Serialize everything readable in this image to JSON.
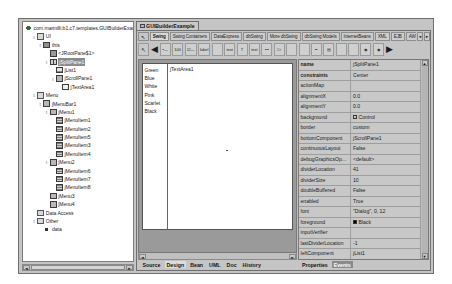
{
  "window": {
    "title": "GUIBuilderExample"
  },
  "structure": {
    "root_label": "com.marinilli.b1.c7.templates.GUIBuilderExample",
    "nodes": [
      {
        "label": "UI",
        "depth": 1,
        "icon": "folder-icon",
        "handle": "expanded",
        "selected": false
      },
      {
        "label": "this",
        "depth": 2,
        "icon": "frame-icon",
        "handle": "expanded",
        "selected": false
      },
      {
        "label": "<JRootPane$1>",
        "depth": 3,
        "icon": "root-pane-icon",
        "handle": "none",
        "selected": false
      },
      {
        "label": "jSplitPane1",
        "depth": 3,
        "icon": "split-pane-icon",
        "handle": "expanded",
        "selected": true
      },
      {
        "label": "jList1",
        "depth": 4,
        "icon": "list-icon",
        "handle": "none",
        "selected": false
      },
      {
        "label": "jScrollPane1",
        "depth": 4,
        "icon": "panel-icon",
        "handle": "expanded",
        "selected": false
      },
      {
        "label": "jTextArea1",
        "depth": 5,
        "icon": "text-area-icon",
        "handle": "none",
        "selected": false
      },
      {
        "label": "Menu",
        "depth": 1,
        "icon": "folder-icon",
        "handle": "expanded",
        "selected": false
      },
      {
        "label": "jMenuBar1",
        "depth": 2,
        "icon": "menubar-icon",
        "handle": "expanded",
        "selected": false
      },
      {
        "label": "jMenu1",
        "depth": 3,
        "icon": "menu-icon",
        "handle": "expanded",
        "selected": false
      },
      {
        "label": "jMenuItem1",
        "depth": 4,
        "icon": "menuitem-icon",
        "handle": "none",
        "selected": false
      },
      {
        "label": "jMenuItem2",
        "depth": 4,
        "icon": "menuitem-icon",
        "handle": "none",
        "selected": false
      },
      {
        "label": "jMenuItem5",
        "depth": 4,
        "icon": "menuitem-icon",
        "handle": "none",
        "selected": false
      },
      {
        "label": "jMenuItem3",
        "depth": 4,
        "icon": "menuitem-icon",
        "handle": "none",
        "selected": false
      },
      {
        "label": "jMenuItem4",
        "depth": 4,
        "icon": "menuitem-icon",
        "handle": "none",
        "selected": false
      },
      {
        "label": "jMenu2",
        "depth": 3,
        "icon": "menu-icon",
        "handle": "expanded",
        "selected": false
      },
      {
        "label": "jMenuItem6",
        "depth": 4,
        "icon": "menuitem-icon",
        "handle": "none",
        "selected": false
      },
      {
        "label": "jMenuItem7",
        "depth": 4,
        "icon": "menuitem-icon",
        "handle": "none",
        "selected": false
      },
      {
        "label": "jMenuItem8",
        "depth": 4,
        "icon": "menuitem-icon",
        "handle": "none",
        "selected": false
      },
      {
        "label": "jMenu3",
        "depth": 3,
        "icon": "menu-icon",
        "handle": "none",
        "selected": false
      },
      {
        "label": "jMenu4",
        "depth": 3,
        "icon": "menu-icon",
        "handle": "none",
        "selected": false
      },
      {
        "label": "Data Access",
        "depth": 1,
        "icon": "folder-icon",
        "handle": "none",
        "selected": false
      },
      {
        "label": "Other",
        "depth": 1,
        "icon": "folder-icon",
        "handle": "expanded",
        "selected": false
      },
      {
        "label": "data",
        "depth": 2,
        "icon": "bean-icon",
        "handle": "none",
        "selected": false
      }
    ],
    "hscroll": {
      "left_arrow": "◄",
      "right_arrow": "►"
    }
  },
  "palette": {
    "cursor_icon": "selection-arrow-icon",
    "prev_icon": "◀",
    "next_icon": "▶",
    "tabs": [
      {
        "label": "Swing",
        "active": true
      },
      {
        "label": "Swing Containers",
        "active": false
      },
      {
        "label": "DataExpress",
        "active": false
      },
      {
        "label": "dbSwing",
        "active": false
      },
      {
        "label": "More dbSwing",
        "active": false
      },
      {
        "label": "dbSwing Models",
        "active": false
      },
      {
        "label": "InternetBeans",
        "active": false
      },
      {
        "label": "XML",
        "active": false
      },
      {
        "label": "EJB",
        "active": false
      },
      {
        "label": "AWT",
        "active": false
      }
    ],
    "scroll_left": "◄",
    "scroll_right": "►",
    "components": [
      {
        "name": "jbutton-tool",
        "glyph": "▪—"
      },
      {
        "name": "jtogglebutton-tool",
        "glyph": "100"
      },
      {
        "name": "jcheckbox-tool",
        "glyph": "☑—"
      },
      {
        "name": "jlabel-tool",
        "glyph": "label"
      },
      {
        "name": "jtextfield-tool",
        "glyph": ""
      },
      {
        "name": "jtextarea-tool",
        "glyph": "text"
      },
      {
        "name": "jtextpane-tool",
        "glyph": "T"
      },
      {
        "name": "jeditorpane-tool",
        "glyph": "text"
      },
      {
        "name": "jpasswordfield-tool",
        "glyph": "•••"
      },
      {
        "name": "jspinner-tool",
        "glyph": "□↕"
      },
      {
        "name": "jlist-tool",
        "glyph": ""
      },
      {
        "name": "jcombobox-tool",
        "glyph": ""
      },
      {
        "name": "jslider-tool",
        "glyph": "━"
      },
      {
        "name": "jprogressbar-tool",
        "glyph": "▤"
      },
      {
        "name": "jtable-tool",
        "glyph": ""
      },
      {
        "name": "jtree-tool",
        "glyph": ""
      },
      {
        "name": "jradiobutton-tool",
        "glyph": "◉"
      },
      {
        "name": "jcheckboxmenuitem-tool",
        "glyph": "◉"
      }
    ]
  },
  "designer": {
    "list_items": [
      "Green",
      "Blue",
      "White",
      "Pink",
      "Scarlet",
      "Black"
    ],
    "textarea_value": "jTextArea1",
    "hscroll": {
      "left_arrow": "◄",
      "right_arrow": "►"
    }
  },
  "inspector": {
    "rows": [
      {
        "name": "name",
        "value": "jSplitPane1",
        "bold": true,
        "swatch": ""
      },
      {
        "name": "constraints",
        "value": "Center",
        "bold": true,
        "swatch": ""
      },
      {
        "name": "actionMap",
        "value": "",
        "bold": false,
        "swatch": ""
      },
      {
        "name": "alignmentX",
        "value": "0.0",
        "bold": false,
        "swatch": ""
      },
      {
        "name": "alignmentY",
        "value": "0.0",
        "bold": false,
        "swatch": ""
      },
      {
        "name": "background",
        "value": "Control",
        "bold": false,
        "swatch": "#d4d0c8"
      },
      {
        "name": "border",
        "value": "custom",
        "bold": false,
        "swatch": ""
      },
      {
        "name": "bottomComponent",
        "value": "jScrollPane1",
        "bold": false,
        "swatch": ""
      },
      {
        "name": "continuousLayout",
        "value": "False",
        "bold": false,
        "swatch": ""
      },
      {
        "name": "debugGraphicsOp...",
        "value": "<default>",
        "bold": false,
        "swatch": ""
      },
      {
        "name": "dividerLocation",
        "value": "41",
        "bold": false,
        "swatch": ""
      },
      {
        "name": "dividerSize",
        "value": "10",
        "bold": false,
        "swatch": ""
      },
      {
        "name": "doubleBuffered",
        "value": "False",
        "bold": false,
        "swatch": ""
      },
      {
        "name": "enabled",
        "value": "True",
        "bold": false,
        "swatch": ""
      },
      {
        "name": "font",
        "value": "\"Dialog\", 0, 12",
        "bold": false,
        "swatch": ""
      },
      {
        "name": "foreground",
        "value": "Black",
        "bold": false,
        "swatch": "#000000"
      },
      {
        "name": "inputVerifier",
        "value": "",
        "bold": false,
        "swatch": ""
      },
      {
        "name": "lastDividerLocation",
        "value": "-1",
        "bold": false,
        "swatch": ""
      },
      {
        "name": "leftComponent",
        "value": "jList1",
        "bold": false,
        "swatch": ""
      },
      {
        "name": "maximumSize",
        "value": "3141 3647, 31474",
        "bold": false,
        "swatch": ""
      }
    ],
    "scroll_up": "▲",
    "scroll_down": "▼",
    "tabs": [
      {
        "label": "Properties",
        "active": false
      },
      {
        "label": "Events",
        "active": true
      }
    ]
  },
  "view_tabs": [
    {
      "label": "Source",
      "active": false
    },
    {
      "label": "Design",
      "active": true
    },
    {
      "label": "Bean",
      "active": false
    },
    {
      "label": "UML",
      "active": false
    },
    {
      "label": "Doc",
      "active": false
    },
    {
      "label": "History",
      "active": false
    }
  ]
}
